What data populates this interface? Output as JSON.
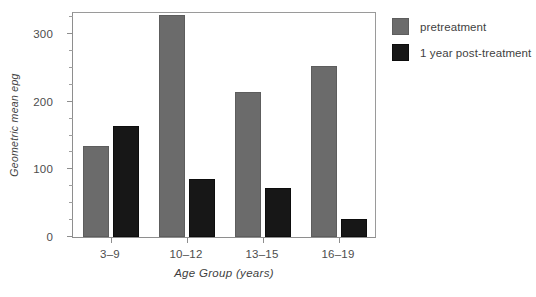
{
  "chart_data": {
    "type": "bar",
    "title": "",
    "xlabel": "Age Group (years)",
    "ylabel": "Geometric mean epg",
    "categories": [
      "3–9",
      "10–12",
      "13–15",
      "16–19"
    ],
    "series": [
      {
        "name": "pretreatment",
        "color": "#6b6b6b",
        "values": [
          134,
          328,
          215,
          253
        ]
      },
      {
        "name": "1 year post-treatment",
        "color": "#171717",
        "values": [
          164,
          86,
          72,
          26
        ]
      }
    ],
    "ylim": [
      0,
      334
    ],
    "yticks": [
      0,
      100,
      200,
      300
    ],
    "ytick_labels": [
      "0",
      "100",
      "200",
      "300"
    ],
    "yminor_step": 25,
    "grid": false,
    "legend_position": "right"
  },
  "legend": {
    "items": [
      {
        "label": "pretreatment",
        "swatch": "pretreatment-swatch"
      },
      {
        "label": "1 year post-treatment",
        "swatch": "post-treatment-swatch"
      }
    ]
  }
}
